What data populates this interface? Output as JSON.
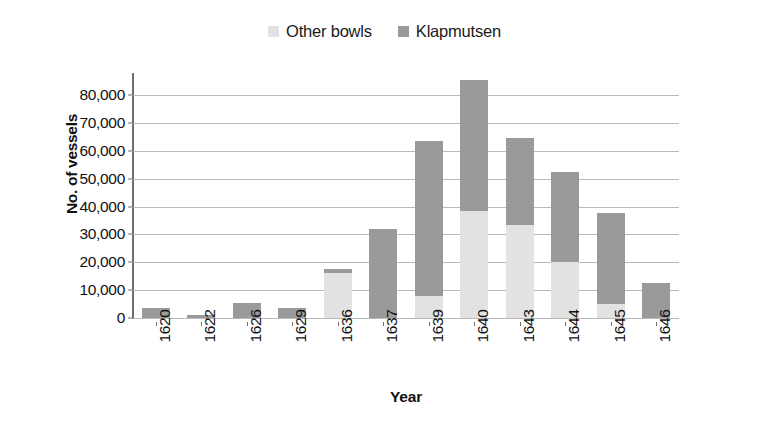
{
  "chart_data": {
    "type": "bar",
    "subtype": "stacked-bar",
    "title": "",
    "xlabel": "Year",
    "ylabel": "No. of vessels",
    "categories": [
      "1620",
      "1622",
      "1626",
      "1629",
      "1636",
      "1637",
      "1639",
      "1640",
      "1643",
      "1644",
      "1645",
      "1646"
    ],
    "series": [
      {
        "name": "Other bowls",
        "color": "#e2e2e2",
        "values": [
          0,
          0,
          0,
          0,
          16000,
          0,
          8000,
          38500,
          33500,
          20000,
          5000,
          0
        ]
      },
      {
        "name": "Klapmutsen",
        "color": "#9a9a9a",
        "values": [
          3500,
          1200,
          5500,
          3500,
          1500,
          32000,
          55500,
          47000,
          31000,
          32500,
          32500,
          12500
        ]
      }
    ],
    "totals": [
      3500,
      1200,
      5500,
      3500,
      17500,
      32000,
      63500,
      85500,
      64500,
      52500,
      37500,
      12500
    ],
    "ylim": [
      0,
      80000
    ],
    "ytick_values": [
      0,
      10000,
      20000,
      30000,
      40000,
      50000,
      60000,
      70000,
      80000
    ],
    "ytick_labels": [
      "0",
      "10,000",
      "20,000",
      "30,000",
      "40,000",
      "50,000",
      "60,000",
      "70,000",
      "80,000"
    ],
    "grid": true,
    "legend_position": "top-center",
    "legend": [
      "Other bowls",
      "Klapmutsen"
    ]
  },
  "colors": {
    "other_bowls": "#e2e2e2",
    "klapmutsen": "#9a9a9a",
    "gridline": "#b9b9b9",
    "axis": "#6e6e6e",
    "text": "#111111"
  }
}
